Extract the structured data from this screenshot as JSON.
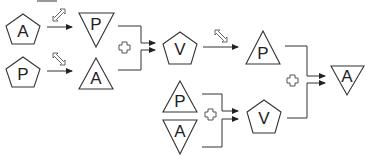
{
  "diagram": {
    "title": "",
    "colors": {
      "stroke": "#333333",
      "background": "#ffffff"
    },
    "top_line": {
      "x1": 37,
      "x2": 57,
      "y": 1
    },
    "nodes": [
      {
        "id": "n1",
        "label": "A",
        "shape": "pentagon",
        "cx": 23,
        "cy": 30
      },
      {
        "id": "n2",
        "label": "P",
        "shape": "pentagon",
        "cx": 23,
        "cy": 73
      },
      {
        "id": "n3",
        "label": "P",
        "shape": "triangle-down",
        "cx": 96,
        "cy": 29
      },
      {
        "id": "n4",
        "label": "A",
        "shape": "triangle-up",
        "cx": 96,
        "cy": 74
      },
      {
        "id": "n5",
        "label": "V",
        "shape": "pentagon",
        "cx": 180,
        "cy": 48
      },
      {
        "id": "n6",
        "label": "P",
        "shape": "triangle-up",
        "cx": 263,
        "cy": 48
      },
      {
        "id": "n7",
        "label": "P",
        "shape": "triangle-up",
        "cx": 180,
        "cy": 97
      },
      {
        "id": "n8",
        "label": "A",
        "shape": "triangle-down",
        "cx": 180,
        "cy": 136
      },
      {
        "id": "n9",
        "label": "V",
        "shape": "pentagon",
        "cx": 264,
        "cy": 116
      },
      {
        "id": "n10",
        "label": "A",
        "shape": "triangle-down",
        "cx": 347,
        "cy": 80
      }
    ],
    "transforms": [
      {
        "from": "n1",
        "to": "n3",
        "icon": "resize-diagonal-ne-sw-icon"
      },
      {
        "from": "n2",
        "to": "n4",
        "icon": "resize-diagonal-nw-se-icon"
      },
      {
        "from": "n5",
        "to": "n6",
        "icon": "resize-diagonal-nw-se-icon"
      }
    ],
    "combinations": [
      {
        "inputs": [
          "n3",
          "n4"
        ],
        "output": "n5",
        "operator": "plus-icon"
      },
      {
        "inputs": [
          "n7",
          "n8"
        ],
        "output": "n9",
        "operator": "plus-icon"
      },
      {
        "inputs": [
          "n6",
          "n9"
        ],
        "output": "n10",
        "operator": "plus-icon"
      }
    ]
  }
}
